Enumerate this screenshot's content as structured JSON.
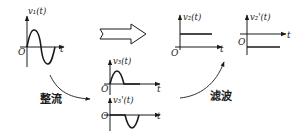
{
  "diagram": {
    "origin_label": "O",
    "time_label": "t",
    "graphs": [
      {
        "id": "v1",
        "label": "v₁(t)",
        "waveform": "sine (one full period)"
      },
      {
        "id": "v3",
        "label": "v₃(t)",
        "waveform": "positive half-wave"
      },
      {
        "id": "v3p",
        "label": "v₃'(t)",
        "waveform": "negative half-wave"
      },
      {
        "id": "v2",
        "label": "v₂(t)",
        "waveform": "positive DC level"
      },
      {
        "id": "v2p",
        "label": "v₂'(t)",
        "waveform": "negative DC level"
      }
    ],
    "steps": {
      "rectify": "整流",
      "filter": "滤波"
    },
    "block_arrow": "equivalent-to arrow"
  }
}
